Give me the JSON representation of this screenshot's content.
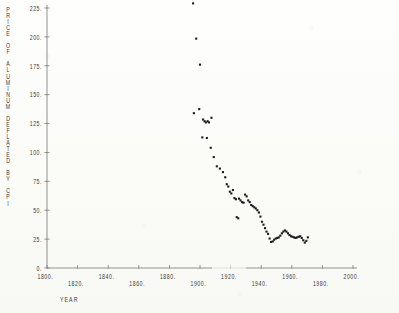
{
  "figure": {
    "kind": "scanned-scatter-plot",
    "ink_color": "#1b1b1b",
    "axis_color": "#6e6e6e",
    "paper_color": "#fbfbf8"
  },
  "axis_title_y_chars": [
    "P",
    "R",
    "I",
    "C",
    "E",
    " ",
    "O",
    "F",
    " ",
    "A",
    "L",
    "U",
    "M",
    "I",
    "N",
    "U",
    "M",
    " ",
    "D",
    "E",
    "F",
    "L",
    "A",
    "T",
    "E",
    "D",
    " ",
    "B",
    "Y",
    " ",
    "C",
    "P",
    "I"
  ],
  "chart_data": {
    "type": "scatter",
    "title": "",
    "xlabel": "YEAR",
    "ylabel": "PRICE OF ALUMINUM DEFLATED BY CPI",
    "xlim": [
      1800,
      2000
    ],
    "ylim": [
      0,
      235
    ],
    "xticks": [
      1800,
      1820,
      1840,
      1860,
      1880,
      1900,
      1920,
      1940,
      1960,
      1980,
      2000
    ],
    "xticklabels": [
      "1800.",
      "1820.",
      "1840.",
      "1860.",
      "1880.",
      "1900.",
      "1920.",
      "1940.",
      "1960.",
      "1980.",
      "2000."
    ],
    "yticks": [
      0,
      25,
      50,
      75,
      100,
      125,
      150,
      175,
      200,
      225
    ],
    "yticklabels": [
      "0.",
      "25.",
      "50.",
      "75.",
      "100.",
      "125.",
      "150.",
      "175.",
      "200.",
      "225."
    ],
    "grid": false,
    "legend": null,
    "marker": "dot",
    "points": [
      [
        1895.5,
        229.0
      ],
      [
        1897.5,
        198.5
      ],
      [
        1900.0,
        176.0
      ],
      [
        1896.0,
        134.0
      ],
      [
        1899.5,
        137.5
      ],
      [
        1902.0,
        128.5
      ],
      [
        1903.0,
        127.0
      ],
      [
        1903.8,
        126.0
      ],
      [
        1905.0,
        127.0
      ],
      [
        1905.8,
        126.0
      ],
      [
        1901.5,
        113.0
      ],
      [
        1904.5,
        112.5
      ],
      [
        1907.5,
        130.0
      ],
      [
        1907.0,
        104.0
      ],
      [
        1909.0,
        96.0
      ],
      [
        1911.0,
        88.0
      ],
      [
        1913.0,
        86.0
      ],
      [
        1915.0,
        83.0
      ],
      [
        1916.5,
        78.5
      ],
      [
        1917.5,
        72.5
      ],
      [
        1918.5,
        70.5
      ],
      [
        1919.5,
        66.0
      ],
      [
        1920.5,
        64.5
      ],
      [
        1921.5,
        67.5
      ],
      [
        1922.5,
        60.5
      ],
      [
        1923.5,
        59.5
      ],
      [
        1924.0,
        44.0
      ],
      [
        1925.0,
        43.0
      ],
      [
        1925.5,
        60.0
      ],
      [
        1926.5,
        58.5
      ],
      [
        1927.5,
        57.0
      ],
      [
        1928.5,
        56.5
      ],
      [
        1929.5,
        63.5
      ],
      [
        1930.5,
        62.0
      ],
      [
        1931.5,
        58.5
      ],
      [
        1932.5,
        57.0
      ],
      [
        1933.5,
        54.5
      ],
      [
        1934.5,
        53.5
      ],
      [
        1935.5,
        52.5
      ],
      [
        1936.5,
        51.5
      ],
      [
        1937.5,
        50.0
      ],
      [
        1938.5,
        48.0
      ],
      [
        1939.5,
        44.5
      ],
      [
        1940.5,
        40.0
      ],
      [
        1941.5,
        37.5
      ],
      [
        1942.5,
        34.5
      ],
      [
        1943.5,
        31.5
      ],
      [
        1944.5,
        29.5
      ],
      [
        1945.5,
        25.5
      ],
      [
        1946.5,
        22.5
      ],
      [
        1947.5,
        23.0
      ],
      [
        1948.5,
        24.5
      ],
      [
        1949.5,
        25.5
      ],
      [
        1950.5,
        26.0
      ],
      [
        1951.5,
        26.5
      ],
      [
        1952.5,
        28.0
      ],
      [
        1953.5,
        30.0
      ],
      [
        1954.5,
        31.5
      ],
      [
        1955.5,
        32.5
      ],
      [
        1956.5,
        31.5
      ],
      [
        1957.5,
        30.0
      ],
      [
        1958.5,
        28.5
      ],
      [
        1959.5,
        27.5
      ],
      [
        1960.5,
        27.0
      ],
      [
        1961.5,
        26.5
      ],
      [
        1962.5,
        26.0
      ],
      [
        1963.5,
        26.5
      ],
      [
        1964.5,
        27.0
      ],
      [
        1965.5,
        27.5
      ],
      [
        1966.5,
        26.0
      ],
      [
        1967.5,
        24.0
      ],
      [
        1968.5,
        22.0
      ],
      [
        1969.5,
        23.5
      ],
      [
        1970.5,
        26.5
      ]
    ]
  }
}
